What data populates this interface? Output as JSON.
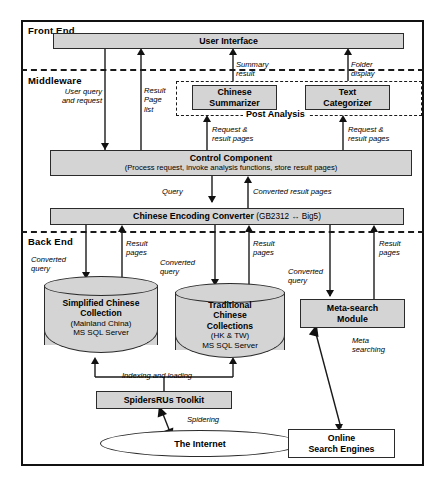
{
  "figure": {
    "tiers": [
      {
        "id": "front-end",
        "label": "Front End"
      },
      {
        "id": "middleware",
        "label": "Middleware"
      },
      {
        "id": "back-end",
        "label": "Back End"
      }
    ],
    "nodes": {
      "user_interface": {
        "title": "User Interface"
      },
      "chinese_summarizer": {
        "line1": "Chinese",
        "line2": "Summarizer"
      },
      "text_categorizer": {
        "line1": "Text",
        "line2": "Categorizer"
      },
      "post_analysis_group": {
        "caption": "Post Analysis"
      },
      "control_component": {
        "title": "Control Component",
        "subtitle": "(Process request, invoke analysis functions, store result pages)"
      },
      "encoding_converter": {
        "title": "Chinese Encoding Converter",
        "suffix": "(GB2312 ↔ Big5)"
      },
      "simplified_collection": {
        "line1": "Simplified Chinese",
        "line2": "Collection",
        "line3": "(Mainland China)",
        "line4": "MS SQL Server"
      },
      "traditional_collection": {
        "line1": "Traditional",
        "line2": "Chinese",
        "line3": "Collections",
        "line4": "(HK & TW)",
        "line5": "MS SQL Server"
      },
      "meta_search_module": {
        "line1": "Meta-search",
        "line2": "Module"
      },
      "spidersrus_toolkit": {
        "title": "SpidersRUs Toolkit"
      },
      "the_internet": {
        "title": "The Internet"
      },
      "online_search_engines": {
        "line1": "Online",
        "line2": "Search Engines"
      }
    },
    "flow_labels": {
      "user_query": "User query\nand request",
      "result_page_list": "Result\nPage\nlist",
      "summary_result": "Summary\nresult",
      "folder_display": "Folder\ndisplay",
      "request_result_pages_left": "Request &\nresult pages",
      "request_result_pages_right": "Request &\nresult pages",
      "query": "Query",
      "converted_result_pages": "Converted result pages",
      "converted_query_1": "Converted\nquery",
      "converted_query_2": "Converted\nquery",
      "converted_query_3": "Converted\nquery",
      "result_pages_1": "Result\npages",
      "result_pages_2": "Result\npages",
      "result_pages_3": "Result\npages",
      "indexing_and_loading": "Indexing and loading",
      "spidering": "Spidering",
      "meta_searching": "Meta\nsearching"
    },
    "colors": {
      "box_fill": "#d4d4d4",
      "stroke": "#2b2b2b",
      "background": "#ffffff"
    }
  }
}
